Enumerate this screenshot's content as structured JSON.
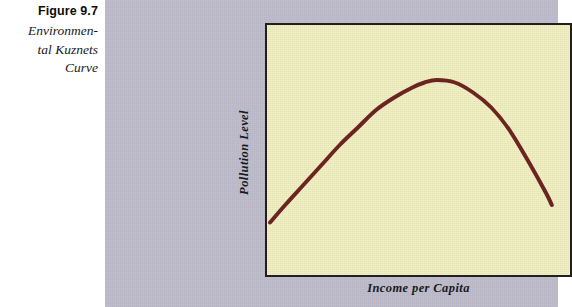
{
  "figure": {
    "number_label": "Figure 9.7",
    "title_lines": [
      "Environmen-",
      "tal Kuznets",
      "Curve"
    ],
    "panel_background_color": "#bcbac8",
    "plot_background_color": "#eeedbe",
    "plot_border_color": "#23201c",
    "curve_color": "#6b2420"
  },
  "chart_data": {
    "type": "line",
    "xlabel": "Income per Capita",
    "ylabel": "Pollution Level",
    "grid": false,
    "legend": "none",
    "axis_ticks": [],
    "xlim": [
      0,
      100
    ],
    "ylim": [
      0,
      100
    ],
    "series": [
      {
        "name": "Environmental Kuznets Curve",
        "color": "#6b2420",
        "line_width": 4,
        "x": [
          1,
          6,
          12,
          18,
          24,
          30,
          36,
          42,
          48,
          52,
          56,
          62,
          68,
          74,
          80,
          86,
          92,
          94
        ],
        "y": [
          21,
          28,
          36,
          44,
          52,
          59,
          66,
          71,
          75,
          77,
          78,
          77,
          73,
          67,
          58,
          46,
          33,
          28
        ]
      }
    ],
    "annotations": [
      {
        "text": "Income per Capita",
        "position": "x-axis-title"
      },
      {
        "text": "Pollution Level",
        "position": "y-axis-title"
      }
    ]
  }
}
